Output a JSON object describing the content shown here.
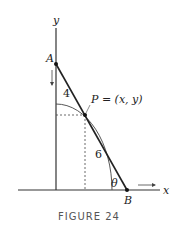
{
  "figure": {
    "caption": "FIGURE 24",
    "axes": {
      "x_label": "x",
      "y_label": "y"
    },
    "points": {
      "A": "A",
      "B": "B",
      "P": "P = (x, y)"
    },
    "segment_labels": {
      "upper": "4",
      "lower": "6"
    },
    "angle_label": "θ"
  }
}
